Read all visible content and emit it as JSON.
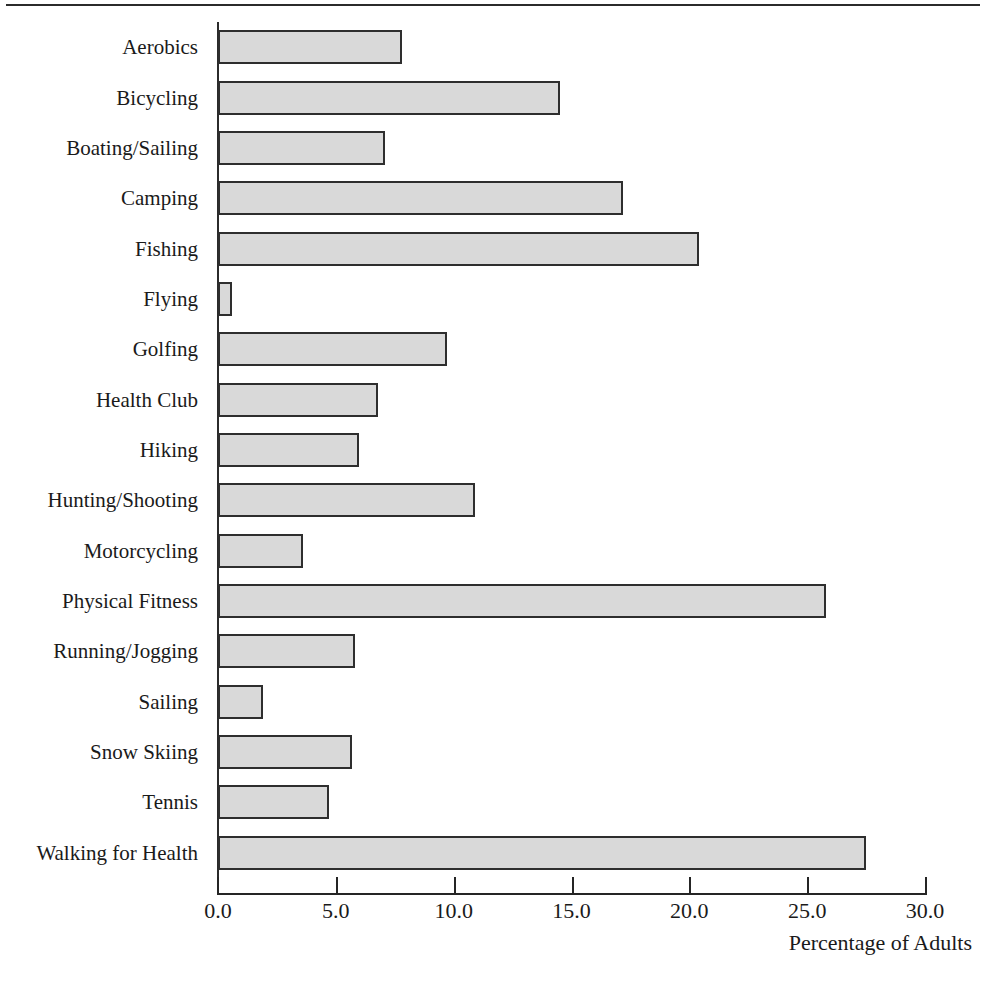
{
  "chart_data": {
    "type": "bar",
    "orientation": "horizontal",
    "title": "",
    "xlabel": "Percentage of Adults",
    "ylabel": "",
    "xlim": [
      0.0,
      30.0
    ],
    "xticks": [
      "0.0",
      "5.0",
      "10.0",
      "15.0",
      "20.0",
      "25.0",
      "30.0"
    ],
    "xtick_values": [
      0,
      5,
      10,
      15,
      20,
      25,
      30
    ],
    "grid": false,
    "legend": "none",
    "categories": [
      "Aerobics",
      "Bicycling",
      "Boating/Sailing",
      "Camping",
      "Fishing",
      "Flying",
      "Golfing",
      "Health Club",
      "Hiking",
      "Hunting/Shooting",
      "Motorcycling",
      "Physical Fitness",
      "Running/Jogging",
      "Sailing",
      "Snow Skiing",
      "Tennis",
      "Walking for Health"
    ],
    "values": [
      7.8,
      14.5,
      7.1,
      17.2,
      20.4,
      0.6,
      9.7,
      6.8,
      6.0,
      10.9,
      3.6,
      25.8,
      5.8,
      1.9,
      5.7,
      4.7,
      27.5
    ]
  },
  "style": {
    "bar_fill": "#d9d9d9",
    "bar_stroke": "#2e2e2e",
    "axis_color": "#252525",
    "text_color": "#1a1a1a",
    "background": "#ffffff"
  }
}
